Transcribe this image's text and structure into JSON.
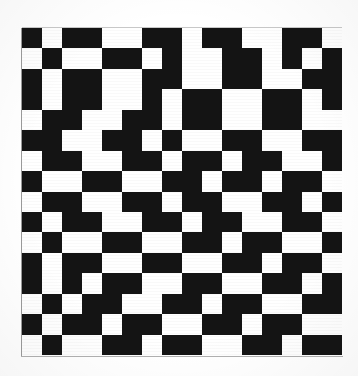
{
  "figure": {
    "name": "binary-checkerboard-pattern-plate",
    "media": "scanned halftone print",
    "background_color": "#ffffff",
    "ink_color": "#141414",
    "paper_color": "#ffffff",
    "edge_line_color": "#9a9a9a"
  },
  "plate": {
    "left_px": 22,
    "top_px": 28,
    "width_px": 320,
    "height_px": 327,
    "cell_width_px": 20,
    "cell_height_px": 20.4
  },
  "chart_data": {
    "type": "heatmap",
    "subtitle": "",
    "xlabel": "",
    "ylabel": "",
    "rows": 16,
    "cols": 16,
    "grid": false,
    "legend": "none",
    "value_labels": {
      "0": "white",
      "1": "black"
    },
    "colors": {
      "0": "#ffffff",
      "1": "#141414"
    },
    "xlim": [
      0,
      16
    ],
    "ylim": [
      0,
      16
    ],
    "xtick_labels": [],
    "ytick_labels": [],
    "matrix": [
      [
        1,
        0,
        1,
        1,
        0,
        0,
        1,
        1,
        0,
        1,
        1,
        0,
        0,
        1,
        1,
        0
      ],
      [
        0,
        1,
        0,
        0,
        1,
        1,
        0,
        1,
        0,
        0,
        1,
        1,
        0,
        1,
        0,
        1
      ],
      [
        1,
        0,
        1,
        1,
        0,
        0,
        1,
        1,
        0,
        0,
        1,
        1,
        0,
        0,
        1,
        1
      ],
      [
        1,
        0,
        1,
        1,
        0,
        0,
        1,
        0,
        1,
        1,
        0,
        0,
        1,
        1,
        0,
        1
      ],
      [
        0,
        1,
        1,
        0,
        0,
        1,
        1,
        0,
        1,
        1,
        0,
        0,
        1,
        1,
        0,
        0
      ],
      [
        1,
        1,
        0,
        0,
        1,
        1,
        0,
        1,
        0,
        0,
        1,
        1,
        0,
        0,
        1,
        1
      ],
      [
        0,
        1,
        1,
        0,
        0,
        1,
        1,
        0,
        1,
        1,
        0,
        1,
        1,
        0,
        0,
        1
      ],
      [
        1,
        0,
        0,
        1,
        1,
        0,
        0,
        1,
        1,
        0,
        1,
        1,
        0,
        1,
        1,
        0
      ],
      [
        0,
        1,
        1,
        0,
        0,
        1,
        1,
        0,
        1,
        1,
        0,
        0,
        1,
        1,
        0,
        1
      ],
      [
        1,
        0,
        1,
        1,
        0,
        0,
        1,
        1,
        0,
        1,
        1,
        0,
        0,
        1,
        1,
        0
      ],
      [
        0,
        1,
        0,
        0,
        1,
        1,
        0,
        0,
        1,
        1,
        0,
        1,
        1,
        0,
        0,
        1
      ],
      [
        1,
        0,
        1,
        1,
        0,
        0,
        1,
        1,
        0,
        0,
        1,
        1,
        0,
        1,
        1,
        0
      ],
      [
        1,
        0,
        1,
        0,
        1,
        1,
        0,
        0,
        1,
        1,
        0,
        0,
        1,
        1,
        0,
        1
      ],
      [
        0,
        1,
        0,
        1,
        1,
        0,
        0,
        1,
        1,
        0,
        1,
        1,
        0,
        0,
        1,
        1
      ],
      [
        1,
        0,
        1,
        1,
        0,
        1,
        1,
        0,
        0,
        1,
        1,
        0,
        1,
        1,
        0,
        0
      ],
      [
        0,
        1,
        0,
        0,
        1,
        1,
        0,
        1,
        1,
        0,
        0,
        1,
        1,
        0,
        1,
        1
      ]
    ]
  }
}
